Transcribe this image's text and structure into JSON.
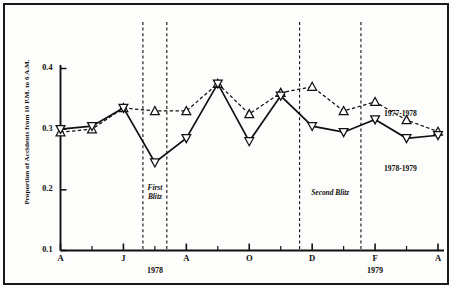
{
  "figure": {
    "background_color": "#fdfdfb",
    "ink_color": "#111111"
  },
  "chart_data": {
    "type": "line",
    "title": "",
    "subtitle": "",
    "xlabel": "",
    "ylabel": "Proportion of Accidents from 10 P.M. to 6 A.M.",
    "ylim": [
      0.1,
      0.43
    ],
    "yticks": [
      "0.1",
      "0.2",
      "0.3",
      "0.4"
    ],
    "ytick_values": [
      0.1,
      0.2,
      0.3,
      0.4
    ],
    "grid": false,
    "legend_position": "inline-right",
    "x": [
      "A",
      "M",
      "J",
      "J",
      "A",
      "S",
      "O",
      "N",
      "D",
      "J",
      "F",
      "M",
      "A"
    ],
    "xtick_labels": [
      "A",
      "J",
      "A",
      "O",
      "D",
      "F",
      "A"
    ],
    "xtick_indices": [
      0,
      2,
      4,
      6,
      8,
      10,
      12
    ],
    "year_labels": [
      {
        "text": "1978",
        "index": 3
      },
      {
        "text": "1979",
        "index": 10
      }
    ],
    "series": [
      {
        "name": "1977-1978",
        "marker": "triangle-up",
        "linestyle": "dashed",
        "values": [
          0.295,
          0.3,
          0.335,
          0.33,
          0.33,
          0.375,
          0.325,
          0.36,
          0.37,
          0.33,
          0.345,
          0.315,
          0.296
        ]
      },
      {
        "name": "1978-1979",
        "marker": "triangle-down",
        "linestyle": "solid",
        "values": [
          0.3,
          0.305,
          0.335,
          0.245,
          0.285,
          0.375,
          0.28,
          0.355,
          0.305,
          0.295,
          0.316,
          0.285,
          0.29
        ]
      }
    ],
    "annotations": [
      {
        "text": "First\nBlitz",
        "label": "first-blitz",
        "span_start_index": 2.62,
        "span_end_index": 3.38
      },
      {
        "text": "Second Blitz",
        "label": "second-blitz",
        "span_start_index": 7.6,
        "span_end_index": 9.55
      }
    ],
    "vertical_rules": [
      2.62,
      3.38,
      7.6,
      9.55
    ]
  },
  "series_inline_labels": [
    {
      "name": "1977-1978"
    },
    {
      "name": "1978-1979"
    }
  ]
}
